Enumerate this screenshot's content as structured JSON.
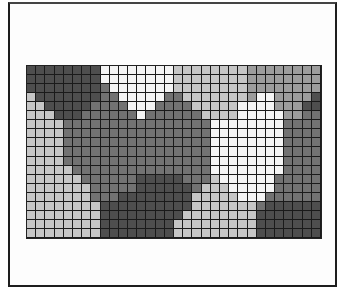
{
  "figure": {
    "type": "pixelated grayscale grid",
    "columns": 32,
    "rows": 19,
    "palette": {
      "D": "#4e4e4e",
      "M": "#727272",
      "G": "#9c9c9c",
      "L": "#c6c6c6",
      "W": "#f4f4f4"
    },
    "cells": [
      "DDDDDDDDWWWWWWWWLLLLLLLLGGGGGGGG",
      "DDDDDDDDWWWWWWWWLLLLLLLLGGGGGGGG",
      "DDDDDDDDMWWWWWWWLLLLLLLLGGGGGGGG",
      "LDDDDDDDMMWWWWWMMLLLLLLLGWWGGGGD",
      "LLDDDDDMMMMWWWMMMMLLLLLWWWWGGGDD",
      "LLLDDDMMMMMMWMMMMMMLLLLWWWWWGGMM",
      "LLLLMMMMMMMMMMMMMMMMWWWWWWWWMMMM",
      "LLLLMMMMMMMMMMMMMMMMWWWWWWWWMMMM",
      "LLLLMMMMMMMMMMMMMMMMWWWWWWWWMMMM",
      "LLLLMMMMMMMMMMMMMMMMWWWWWWWWMMMM",
      "LLLLMMMMMMMMMMMMMMMMWWWWWWWWMMMM",
      "LLLLLMMMMMMMMMMMMMMMWWWWWWWWMMMM",
      "LLLLLLMMMMMMDDDDDMMMLWWWWWWMMMMM",
      "LLLLLLLMMMMMDDDDDDMLLLWWWWWMMMMM",
      "LLLLLLLMMMDDDDDDDDLLLLLWWWMMMMMM",
      "LLLLLLLLDDDDDDDDDDLLLLLLLMDDDDDD",
      "LLLLLLLLDDDDDDDDDLLLLLLLLDDDDDDD",
      "LLLLLLLLDDDDDDDDLLLLLLLLLDDDDDDD",
      "LLLLLLLLDDDDDDDDLLLLLLLLLDDDDDDD"
    ]
  }
}
